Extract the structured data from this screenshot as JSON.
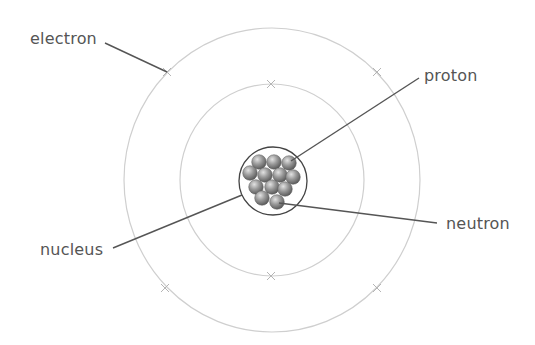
{
  "diagram": {
    "labels": {
      "electron": "electron",
      "proton": "proton",
      "nucleus": "nucleus",
      "neutron": "neutron"
    },
    "colors": {
      "orbit": "#cfcfcf",
      "leader": "#555555",
      "text": "#555555",
      "particle_light": "#d8d8d8",
      "particle_dark": "#5a5a5a",
      "nucleus_outline": "#444444"
    },
    "orbits": [
      {
        "name": "inner-orbit",
        "cx": 272,
        "cy": 180,
        "rx": 92,
        "ry": 96,
        "electrons": [
          [
            271,
            84
          ],
          [
            271,
            276
          ]
        ]
      },
      {
        "name": "outer-orbit",
        "cx": 272,
        "cy": 180,
        "rx": 148,
        "ry": 152,
        "electrons": [
          [
            167,
            72
          ],
          [
            377,
            72
          ],
          [
            165,
            288
          ],
          [
            377,
            288
          ]
        ]
      }
    ],
    "nucleus": {
      "cx": 273,
      "cy": 181,
      "r": 34
    },
    "particles": [
      [
        259,
        162
      ],
      [
        274,
        162
      ],
      [
        289,
        163
      ],
      [
        250,
        173
      ],
      [
        265,
        175
      ],
      [
        280,
        175
      ],
      [
        293,
        177
      ],
      [
        256,
        187
      ],
      [
        272,
        187
      ],
      [
        285,
        189
      ],
      [
        262,
        198
      ],
      [
        277,
        202
      ]
    ],
    "particle_radius": 7.3,
    "leaders": [
      {
        "name": "electron-leader",
        "x1": 105,
        "y1": 43,
        "x2": 167,
        "y2": 72
      },
      {
        "name": "proton-leader",
        "x1": 291,
        "y1": 161,
        "x2": 419,
        "y2": 78
      },
      {
        "name": "nucleus-leader",
        "x1": 113,
        "y1": 248,
        "x2": 242,
        "y2": 195
      },
      {
        "name": "neutron-leader",
        "x1": 279,
        "y1": 203,
        "x2": 437,
        "y2": 223
      }
    ]
  }
}
